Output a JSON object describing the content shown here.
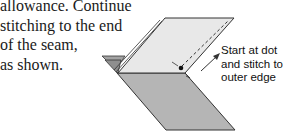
{
  "paragraph": {
    "lines": [
      "allowance. Continue",
      "stitching to the end",
      "of the seam,",
      "as shown."
    ]
  },
  "diagram": {
    "callout": {
      "lines": [
        "Start at dot",
        "and stitch to",
        "outer edge"
      ]
    },
    "colors": {
      "top_panel": "#e6e6e6",
      "bottom_panel": "#b3b3b3",
      "flap": "#9a9a9a",
      "stroke": "#333333"
    }
  }
}
